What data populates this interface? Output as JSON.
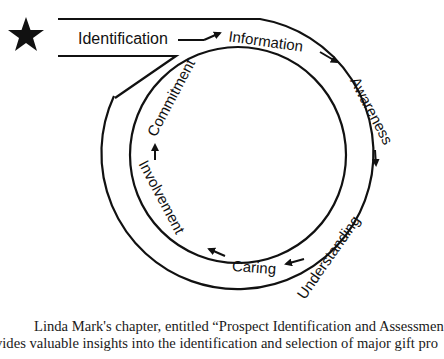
{
  "diagram": {
    "start_marker": "star-icon",
    "stages": [
      {
        "label": "Identification"
      },
      {
        "label": "Information"
      },
      {
        "label": "Awareness"
      },
      {
        "label": "Understanding"
      },
      {
        "label": "Caring"
      },
      {
        "label": "Involvement"
      },
      {
        "label": "Commitment"
      }
    ],
    "flow": "Identification → Information → Awareness → Understanding → Caring → Involvement → Commitment → Identification",
    "line_color": "#111111"
  },
  "caption": {
    "lines": [
      "Linda Mark's chapter, entitled “Prospect Identification and Assessmen",
      "vides valuable insights into the identification and selection of major gift pro",
      "and a Gift's Ludgement as a process, details and the steps to find their infor"
    ]
  }
}
